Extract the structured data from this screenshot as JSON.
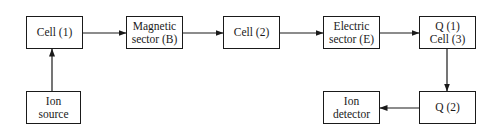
{
  "diagram": {
    "colors": {
      "stroke": "#1a1a1a",
      "background": "#ffffff"
    },
    "nodes": [
      {
        "id": "cell1",
        "lines": [
          "Cell (1)"
        ],
        "x": 26,
        "y": 16,
        "w": 57,
        "h": 33
      },
      {
        "id": "magnetic",
        "lines": [
          "Magnetic",
          "sector (B)"
        ],
        "x": 126,
        "y": 16,
        "w": 57,
        "h": 33
      },
      {
        "id": "cell2",
        "lines": [
          "Cell (2)"
        ],
        "x": 223,
        "y": 16,
        "w": 57,
        "h": 33
      },
      {
        "id": "electric",
        "lines": [
          "Electric",
          "sector (E)"
        ],
        "x": 323,
        "y": 16,
        "w": 57,
        "h": 33
      },
      {
        "id": "q1cell3",
        "lines": [
          "Q (1)",
          "Cell (3)"
        ],
        "x": 419,
        "y": 16,
        "w": 57,
        "h": 33
      },
      {
        "id": "ionsource",
        "lines": [
          "Ion",
          "source"
        ],
        "x": 26,
        "y": 91,
        "w": 55,
        "h": 33
      },
      {
        "id": "iondetector",
        "lines": [
          "Ion",
          "detector"
        ],
        "x": 323,
        "y": 91,
        "w": 57,
        "h": 33
      },
      {
        "id": "q2",
        "lines": [
          "Q (2)"
        ],
        "x": 419,
        "y": 91,
        "w": 57,
        "h": 33
      }
    ],
    "edges": [
      {
        "from": "ionsource",
        "to": "cell1"
      },
      {
        "from": "cell1",
        "to": "magnetic"
      },
      {
        "from": "magnetic",
        "to": "cell2"
      },
      {
        "from": "cell2",
        "to": "electric"
      },
      {
        "from": "electric",
        "to": "q1cell3"
      },
      {
        "from": "q1cell3",
        "to": "q2"
      },
      {
        "from": "q2",
        "to": "iondetector"
      }
    ]
  }
}
